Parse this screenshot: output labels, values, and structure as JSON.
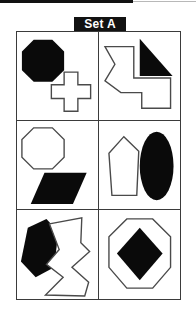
{
  "figure": {
    "title": "Set A",
    "ink_color": "#0a0a0a",
    "outline_color": "#4a4a4a",
    "background_color": "#ffffff",
    "label_background": "#121212",
    "label_text_color": "#ffffff"
  },
  "grid": {
    "rows": 3,
    "columns": 2,
    "cells": [
      {
        "position": "row-1-col-1",
        "shapes": [
          {
            "name": "octagon",
            "fill": "black",
            "placement": "upper-left"
          },
          {
            "name": "cross",
            "fill": "white",
            "placement": "lower-right"
          }
        ]
      },
      {
        "position": "row-1-col-2",
        "shapes": [
          {
            "name": "zigzag-polygon",
            "fill": "white",
            "placement": "left"
          },
          {
            "name": "right-triangle",
            "fill": "black",
            "placement": "upper-right"
          }
        ]
      },
      {
        "position": "row-2-col-1",
        "shapes": [
          {
            "name": "octagon",
            "fill": "white",
            "placement": "upper-left"
          },
          {
            "name": "parallelogram",
            "fill": "black",
            "placement": "lower-right"
          }
        ]
      },
      {
        "position": "row-2-col-2",
        "shapes": [
          {
            "name": "pentagon-kite",
            "fill": "white",
            "placement": "left"
          },
          {
            "name": "ellipse",
            "fill": "black",
            "placement": "right"
          }
        ]
      },
      {
        "position": "row-3-col-1",
        "shapes": [
          {
            "name": "hexagon",
            "fill": "black",
            "placement": "left"
          },
          {
            "name": "zigzag-arrow-polygon",
            "fill": "white",
            "placement": "right"
          }
        ]
      },
      {
        "position": "row-3-col-2",
        "shapes": [
          {
            "name": "octagon",
            "fill": "white",
            "placement": "center"
          },
          {
            "name": "diamond",
            "fill": "black",
            "placement": "center-inset"
          }
        ]
      }
    ]
  }
}
